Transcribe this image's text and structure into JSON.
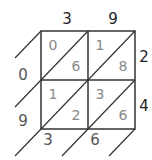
{
  "diagram": {
    "type": "lattice-multiplication",
    "multiplicand": [
      "3",
      "9"
    ],
    "multiplier": [
      "2",
      "4"
    ],
    "cells": [
      [
        {
          "tens": "0",
          "ones": "6"
        },
        {
          "tens": "1",
          "ones": "8"
        }
      ],
      [
        {
          "tens": "1",
          "ones": "2"
        },
        {
          "tens": "3",
          "ones": "6"
        }
      ]
    ],
    "result_left": [
      "0",
      "9"
    ],
    "result_bottom": [
      "3",
      "6"
    ],
    "colors": {
      "grid": "#333333",
      "cell_digits": "#888888",
      "labels": "#222222"
    }
  }
}
